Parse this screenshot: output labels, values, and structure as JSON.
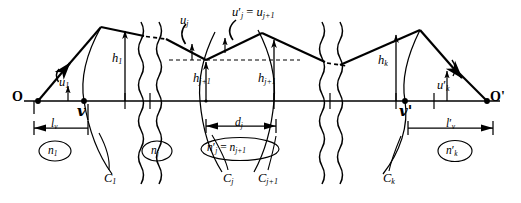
{
  "figure": {
    "type": "optical-ray-trace-diagram",
    "axis": {
      "name": "optical-axis"
    },
    "object_point": {
      "label": "O",
      "x": 38,
      "y": 101
    },
    "image_point": {
      "label": "O'",
      "x": 487,
      "y": 101
    },
    "vertices": [
      {
        "label": "v",
        "x": 84,
        "y": 101,
        "name": "first-vertex"
      },
      {
        "label": "v'",
        "x": 405,
        "y": 101,
        "name": "last-vertex"
      }
    ],
    "angles": [
      {
        "label": "u",
        "sub": "1",
        "prime": false,
        "x": 59,
        "y": 76
      },
      {
        "label": "u",
        "sub": "j",
        "prime": false,
        "x": 180,
        "y": 14
      },
      {
        "label": "u",
        "sub": "k",
        "prime": true,
        "x": 440,
        "y": 79
      }
    ],
    "top_equation": {
      "lhs": "u",
      "lhs_sub": "j",
      "rhs": "u",
      "rhs_sub": "j+1",
      "text": "u'j = uj+1",
      "x": 238,
      "y": 7
    },
    "heights": [
      {
        "label": "h",
        "sub": "1",
        "x": 112,
        "y": 56
      },
      {
        "label": "h",
        "sub": "j+1",
        "x": 206,
        "y": 73
      },
      {
        "label": "h",
        "sub": "j+1",
        "x": 262,
        "y": 73
      },
      {
        "label": "h",
        "sub": "k",
        "x": 381,
        "y": 58
      }
    ],
    "dimensions": [
      {
        "label": "l",
        "sub": "v",
        "prime": false,
        "x": 44,
        "y": 123,
        "name": "object-distance"
      },
      {
        "label": "d",
        "sub": "j",
        "prime": false,
        "x": 243,
        "y": 121,
        "name": "surface-separation"
      },
      {
        "label": "l",
        "sub": "v",
        "prime": true,
        "x": 451,
        "y": 123,
        "name": "image-distance"
      }
    ],
    "indices": [
      {
        "label": "n",
        "sub": "1",
        "prime": false,
        "x": 55,
        "y": 150,
        "name": "index-first-space"
      },
      {
        "label": "n",
        "sub": "j",
        "prime": false,
        "x": 157,
        "y": 150,
        "name": "index-j-space"
      },
      {
        "label": "n",
        "sub": "k",
        "prime": true,
        "x": 455,
        "y": 150,
        "name": "index-last-space"
      }
    ],
    "index_equation": {
      "text": "n'j = nj+1",
      "x": 207,
      "y": 147,
      "name": "index-equality"
    },
    "surfaces": [
      {
        "label": "C",
        "sub": "1",
        "x": 109,
        "y": 177,
        "name": "surface-C1"
      },
      {
        "label": "C",
        "sub": "j",
        "x": 228,
        "y": 177,
        "name": "surface-Cj"
      },
      {
        "label": "C",
        "sub": "j+1",
        "x": 265,
        "y": 177,
        "name": "surface-Cj1"
      },
      {
        "label": "C",
        "sub": "k",
        "x": 389,
        "y": 177,
        "name": "surface-Ck"
      }
    ],
    "break_marks": [
      {
        "name": "break-left",
        "x1": 141,
        "x2": 158
      },
      {
        "name": "break-right",
        "x1": 322,
        "x2": 339
      }
    ],
    "colors": {
      "ink": "#000000",
      "paper": "#ffffff"
    }
  }
}
